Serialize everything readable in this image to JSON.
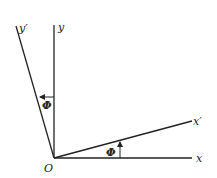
{
  "diagram": {
    "origin_label": "O",
    "axes": [
      {
        "name": "x",
        "label": "x"
      },
      {
        "name": "y",
        "label": "y"
      },
      {
        "name": "x_prime",
        "label": "x′"
      },
      {
        "name": "y_prime",
        "label": "y′"
      }
    ],
    "angle_labels": [
      {
        "between": "x and x′",
        "label": "Φ"
      },
      {
        "between": "y and y′",
        "label": "Φ"
      }
    ],
    "colors": {
      "line": "#222222",
      "background": "#ffffff"
    }
  }
}
